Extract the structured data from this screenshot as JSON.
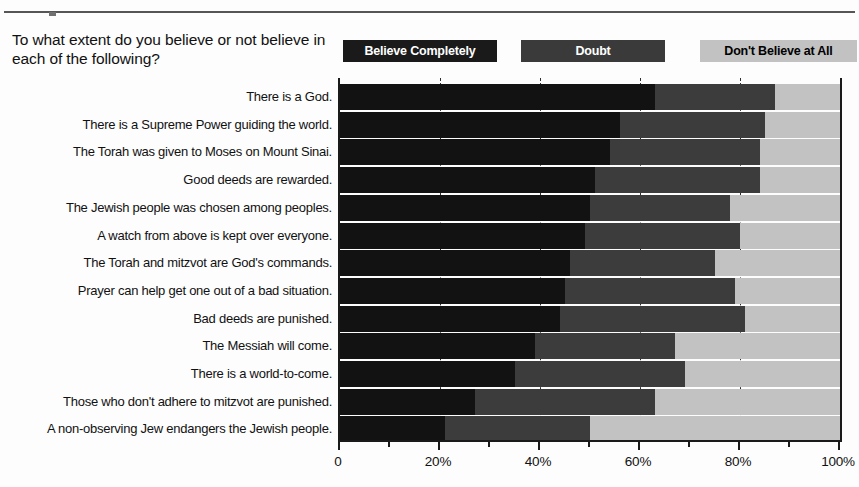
{
  "header": {
    "question": "To what extent do you believe or not believe in each of the following?"
  },
  "legend": {
    "items": [
      {
        "label": "Believe Completely",
        "color": "#1a1a1a",
        "text_color": "#ffffff"
      },
      {
        "label": "Doubt",
        "color": "#3a3a3a",
        "text_color": "#ffffff"
      },
      {
        "label": "Don't Believe at All",
        "color": "#c2c2c2",
        "text_color": "#000000"
      }
    ]
  },
  "chart_data": {
    "type": "bar",
    "orientation": "horizontal",
    "stacked": true,
    "title": "To what extent do you believe or not believe in each of the following?",
    "xlabel": "",
    "ylabel": "",
    "xlim": [
      0,
      100
    ],
    "xticks": [
      0,
      20,
      40,
      60,
      80,
      100
    ],
    "xtick_labels": [
      "0",
      "20%",
      "40%",
      "60%",
      "80%",
      "100%"
    ],
    "minor_xticks": [
      10,
      30,
      50,
      70,
      90
    ],
    "grid": true,
    "grid_axis": "x",
    "grid_style": "dashed",
    "legend_position": "top-right",
    "categories": [
      "There is a God.",
      "There is a Supreme Power guiding the world.",
      "The Torah was given to Moses on Mount Sinai.",
      "Good deeds are rewarded.",
      "The Jewish people was chosen among peoples.",
      "A watch from above is kept over everyone.",
      "The Torah and mitzvot are God's commands.",
      "Prayer can help get one out of a bad situation.",
      "Bad deeds are punished.",
      "The Messiah will come.",
      "There is a world-to-come.",
      "Those who don't adhere to mitzvot are punished.",
      "A non-observing Jew endangers the Jewish people."
    ],
    "series": [
      {
        "name": "Believe Completely",
        "color": "#121212",
        "values": [
          63,
          56,
          54,
          51,
          50,
          49,
          46,
          45,
          44,
          39,
          35,
          27,
          21
        ]
      },
      {
        "name": "Doubt",
        "color": "#3c3c3c",
        "values": [
          24,
          29,
          30,
          33,
          28,
          31,
          29,
          34,
          37,
          28,
          34,
          36,
          29
        ]
      },
      {
        "name": "Don't Believe at All",
        "color": "#c2c2c2",
        "values": [
          13,
          15,
          16,
          16,
          22,
          20,
          25,
          21,
          19,
          33,
          31,
          37,
          50
        ]
      }
    ]
  }
}
